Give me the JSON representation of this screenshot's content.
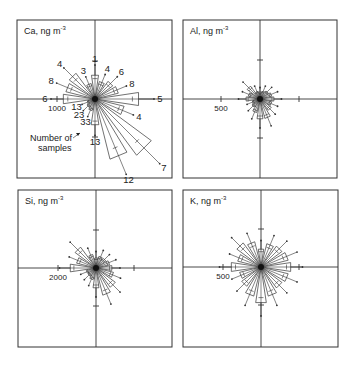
{
  "figure": {
    "type": "wind-rose pollution roses",
    "panels": [
      {
        "id": "ca",
        "element": "Ca",
        "unit": "ng m",
        "unit_exp": "-3",
        "frame": [
          17,
          20,
          155,
          158
        ],
        "center": [
          95,
          99
        ],
        "scale_label": "1000",
        "scale_px": 38,
        "petals": [
          {
            "dir": 0,
            "r": 24,
            "n": "1"
          },
          {
            "dir": 22.5,
            "r": 18,
            "n": "4"
          },
          {
            "dir": 45,
            "r": 22,
            "n": "6"
          },
          {
            "dir": 67.5,
            "r": 24,
            "n": "8"
          },
          {
            "dir": 90,
            "r": 44,
            "n": "5"
          },
          {
            "dir": 112.5,
            "r": 30,
            "n": "4"
          },
          {
            "dir": 135,
            "r": 70,
            "n": "7"
          },
          {
            "dir": 157.5,
            "r": 62,
            "n": "12"
          },
          {
            "dir": 180,
            "r": 26,
            "n": "13"
          },
          {
            "dir": 202.5,
            "r": 12,
            "n": "33"
          },
          {
            "dir": 225,
            "r": 10,
            "n": "23"
          },
          {
            "dir": 247.5,
            "r": 8,
            "n": "13"
          },
          {
            "dir": 270,
            "r": 32,
            "n": "6"
          },
          {
            "dir": 292.5,
            "r": 30,
            "n": "8"
          },
          {
            "dir": 315,
            "r": 32,
            "n": "4"
          },
          {
            "dir": 337.5,
            "r": 16,
            "n": "3"
          }
        ],
        "extra_labels": [
          {
            "text": "5",
            "x": 80,
            "y": 72
          },
          {
            "text": "6",
            "x": 56,
            "y": 72
          }
        ],
        "annotation": {
          "line1": "Number  of",
          "line2": "samples"
        }
      },
      {
        "id": "al",
        "element": "Al",
        "unit": "ng m",
        "unit_exp": "-3",
        "frame": [
          183,
          20,
          154,
          158
        ],
        "center": [
          260,
          99
        ],
        "scale_label": "500",
        "scale_px": 39,
        "petals": [
          {
            "dir": 0,
            "r": 6
          },
          {
            "dir": 22.5,
            "r": 8
          },
          {
            "dir": 45,
            "r": 10
          },
          {
            "dir": 67.5,
            "r": 12
          },
          {
            "dir": 90,
            "r": 14
          },
          {
            "dir": 112.5,
            "r": 12
          },
          {
            "dir": 135,
            "r": 14
          },
          {
            "dir": 157.5,
            "r": 20
          },
          {
            "dir": 180,
            "r": 20
          },
          {
            "dir": 202.5,
            "r": 14
          },
          {
            "dir": 225,
            "r": 10
          },
          {
            "dir": 247.5,
            "r": 8
          },
          {
            "dir": 270,
            "r": 14
          },
          {
            "dir": 292.5,
            "r": 12
          },
          {
            "dir": 315,
            "r": 16
          },
          {
            "dir": 337.5,
            "r": 8
          }
        ]
      },
      {
        "id": "si",
        "element": "Si",
        "unit": "ng m",
        "unit_exp": "-3",
        "frame": [
          18,
          190,
          154,
          157
        ],
        "center": [
          96,
          268
        ],
        "scale_label": "2000",
        "scale_px": 38,
        "petals": [
          {
            "dir": 0,
            "r": 10
          },
          {
            "dir": 22.5,
            "r": 12
          },
          {
            "dir": 45,
            "r": 12
          },
          {
            "dir": 67.5,
            "r": 14
          },
          {
            "dir": 90,
            "r": 16
          },
          {
            "dir": 112.5,
            "r": 18
          },
          {
            "dir": 135,
            "r": 24
          },
          {
            "dir": 157.5,
            "r": 28
          },
          {
            "dir": 180,
            "r": 20
          },
          {
            "dir": 202.5,
            "r": 12
          },
          {
            "dir": 225,
            "r": 10
          },
          {
            "dir": 247.5,
            "r": 10
          },
          {
            "dir": 270,
            "r": 26
          },
          {
            "dir": 292.5,
            "r": 20
          },
          {
            "dir": 315,
            "r": 26
          },
          {
            "dir": 337.5,
            "r": 14
          }
        ]
      },
      {
        "id": "k",
        "element": "K",
        "unit": "ng m",
        "unit_exp": "-3",
        "frame": [
          183,
          190,
          155,
          157
        ],
        "center": [
          261,
          267
        ],
        "scale_label": "500",
        "scale_px": 38,
        "petals": [
          {
            "dir": 0,
            "r": 18
          },
          {
            "dir": 22.5,
            "r": 24
          },
          {
            "dir": 45,
            "r": 26
          },
          {
            "dir": 67.5,
            "r": 28
          },
          {
            "dir": 90,
            "r": 30
          },
          {
            "dir": 112.5,
            "r": 28
          },
          {
            "dir": 135,
            "r": 26
          },
          {
            "dir": 157.5,
            "r": 30
          },
          {
            "dir": 180,
            "r": 36
          },
          {
            "dir": 202.5,
            "r": 30
          },
          {
            "dir": 225,
            "r": 24
          },
          {
            "dir": 247.5,
            "r": 22
          },
          {
            "dir": 270,
            "r": 30
          },
          {
            "dir": 292.5,
            "r": 24
          },
          {
            "dir": 315,
            "r": 30
          },
          {
            "dir": 337.5,
            "r": 26
          }
        ]
      }
    ]
  }
}
